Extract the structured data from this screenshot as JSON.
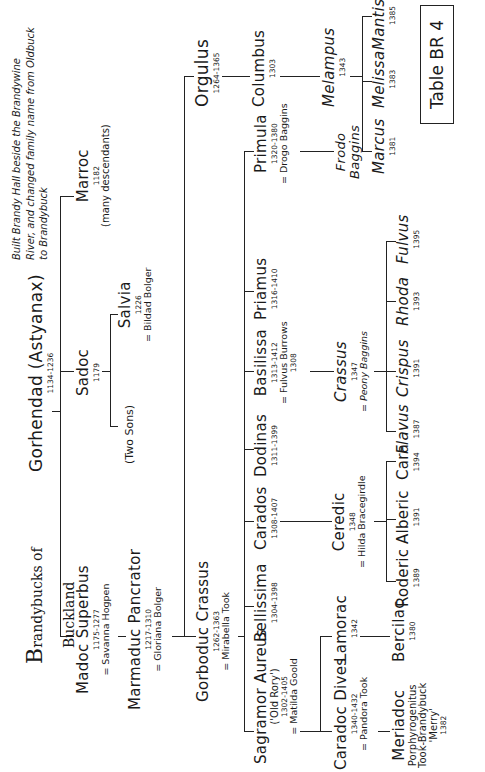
{
  "title": {
    "line1": "Brandybucks of",
    "line2": "Buckland",
    "cap": "B"
  },
  "table_label": "Table BR 4",
  "note": [
    "Built Brandy Hall beside the Brandywine",
    "River, and changed family name from Oldbuck",
    "to Brandybuck"
  ],
  "people": {
    "gorhendad": {
      "name": "Gorhendad (Astyanax)",
      "dates": "1134-1236"
    },
    "marroc": {
      "name": "Marroc",
      "dates": "1182",
      "extra": "(many descendants)"
    },
    "sadoc": {
      "name": "Sadoc",
      "dates": "1179"
    },
    "salvia": {
      "name": "Salvia",
      "dates": "1226",
      "spouse": "= Bildad Bolger"
    },
    "two_sons": {
      "name": "(Two Sons)"
    },
    "madoc": {
      "name": "Madoc Superbus",
      "dates": "1175-1277",
      "spouse": "= Savanna Hogpen"
    },
    "marmaduc": {
      "name": "Marmaduc Pancrator",
      "dates": "1217-1310",
      "spouse": "= Gloriana Bolger"
    },
    "gorboduc": {
      "name": "Gorboduc Crassus",
      "dates": "1262-1363",
      "spouse": "= Mirabella Took"
    },
    "orgulus": {
      "name": "Orgulus",
      "dates": "1264-1365"
    },
    "columbus": {
      "name": "Columbus",
      "dates": "1303"
    },
    "melampus": {
      "name": "Melampus",
      "dates": "1343"
    },
    "marcus": {
      "name": "Marcus",
      "dates": "1381"
    },
    "melissa": {
      "name": "Melissa",
      "dates": "1383"
    },
    "mantissa": {
      "name": "Mantissa",
      "dates": "1385"
    },
    "sagramor": {
      "name": "Sagramor Aureus",
      "nick": "('Old Rory')",
      "dates": "1302-1405",
      "spouse": "= Matilda Goold"
    },
    "bellissima": {
      "name": "Bellissima",
      "dates": "1304-1398"
    },
    "carados": {
      "name": "Carados",
      "dates": "1308-1407"
    },
    "dodinas": {
      "name": "Dodinas",
      "dates": "1311-1399"
    },
    "basilissa": {
      "name": "Basilissa",
      "dates": "1313-1412",
      "spouse": "= Fulvus Burrows",
      "spouse_dates": "1308"
    },
    "priamus": {
      "name": "Priamus",
      "dates": "1316-1410"
    },
    "primula": {
      "name": "Primula",
      "dates": "1320-1380",
      "spouse": "= Drogo Baggins"
    },
    "frodo": {
      "name": "Frodo Baggins"
    },
    "caradoc": {
      "name": "Caradoc Dives",
      "dates": "1340-1432",
      "spouse": "= Pandora Took"
    },
    "lamorac": {
      "name": "Lamorac",
      "dates": "1342"
    },
    "meriadoc": {
      "name": "Meriadoc",
      "line2": "Porphyrogenitus",
      "line3": "Took-Brandybuck",
      "line4": "'Merry'",
      "dates": "1382"
    },
    "bercilac": {
      "name": "Bercilac",
      "dates": "1380"
    },
    "ceredic": {
      "name": "Ceredic",
      "dates": "1348",
      "spouse": "= Hilda Bracegirdle"
    },
    "roderic": {
      "name": "Roderic",
      "dates": "1389"
    },
    "alberic": {
      "name": "Alberic",
      "dates": "1391"
    },
    "cara": {
      "name": "Cara",
      "dates": "1394"
    },
    "crassus": {
      "name": "Crassus",
      "dates": "1347",
      "spouse": "= Peony Baggins"
    },
    "flavus": {
      "name": "Flavus",
      "dates": "1387"
    },
    "crispus": {
      "name": "Crispus",
      "dates": "1391"
    },
    "rhoda": {
      "name": "Rhoda",
      "dates": "1393"
    },
    "fulvus": {
      "name": "Fulvus",
      "dates": "1395"
    }
  }
}
